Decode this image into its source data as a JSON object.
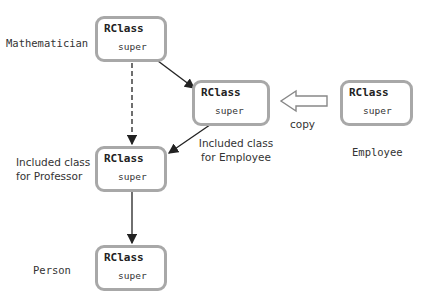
{
  "diagram": {
    "boxes": {
      "mathematician": {
        "title": "RClass",
        "field": "super"
      },
      "included_employee": {
        "title": "RClass",
        "field": "super"
      },
      "employee": {
        "title": "RClass",
        "field": "super"
      },
      "included_professor": {
        "title": "RClass",
        "field": "super"
      },
      "person": {
        "title": "RClass",
        "field": "super"
      }
    },
    "labels": {
      "mathematician": "Mathematician",
      "included_employee_line1": "Included class",
      "included_employee_line2": "for Employee",
      "employee": "Employee",
      "included_professor_line1": "Included class",
      "included_professor_line2": "for Professor",
      "person": "Person",
      "copy": "copy"
    },
    "colors": {
      "box_border": "#a8a8a8",
      "arrow": "#222222",
      "copy_arrow_outline": "#888888"
    }
  }
}
